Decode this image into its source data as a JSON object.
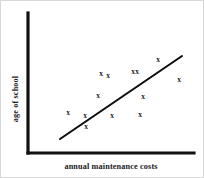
{
  "chart_data": {
    "type": "scatter",
    "title": "",
    "xlabel": "annual maintenance costs",
    "ylabel": "age of school",
    "grid": false,
    "legend": null,
    "axis_ticks": {
      "x": [],
      "y": []
    },
    "marker_symbol": "x",
    "points": [
      {
        "x": 67,
        "y": 111
      },
      {
        "x": 84,
        "y": 114
      },
      {
        "x": 85,
        "y": 125
      },
      {
        "x": 97,
        "y": 94
      },
      {
        "x": 107,
        "y": 74
      },
      {
        "x": 111,
        "y": 114
      },
      {
        "x": 136,
        "y": 70
      },
      {
        "x": 139,
        "y": 113
      },
      {
        "x": 142,
        "y": 95
      },
      {
        "x": 157,
        "y": 58
      },
      {
        "x": 178,
        "y": 78
      },
      {
        "x": 100,
        "y": 72
      },
      {
        "x": 132,
        "y": 70
      }
    ],
    "trend_line": {
      "x1": 59,
      "y1": 138,
      "x2": 181,
      "y2": 55
    },
    "axes_frame": {
      "origin_x": 27,
      "origin_y": 152,
      "y_axis_top": 12,
      "x_axis_right": 193
    },
    "label_positions": {
      "xlabel_x": 110,
      "xlabel_y": 168,
      "ylabel_x": 17,
      "ylabel_y": 98
    }
  },
  "colors": {
    "ink": "#111111",
    "marker": "#1a1a1a",
    "background": "#ffffff",
    "frame_border": "#d8d8d8"
  }
}
